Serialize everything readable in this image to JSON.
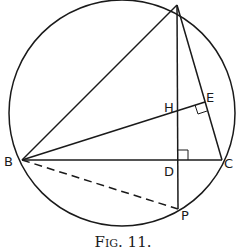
{
  "figure": {
    "caption": "Fig. 11.",
    "caption_small_caps": "FIG. 11.",
    "labels": {
      "A": "",
      "B": "B",
      "C": "C",
      "D": "D",
      "E": "E",
      "H": "H",
      "P": "P"
    },
    "colors": {
      "ink": "#1a1a1a",
      "background": "#ffffff"
    }
  }
}
